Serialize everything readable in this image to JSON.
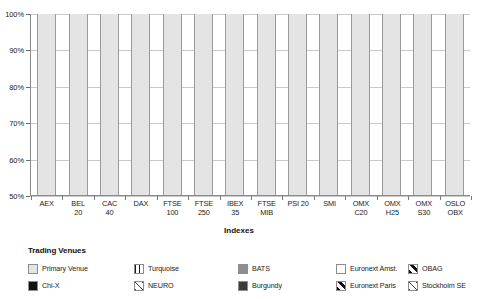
{
  "chart_data": {
    "type": "bar",
    "subtype": "stacked-percentage",
    "title": "",
    "xlabel": "Indexes",
    "ylabel": "",
    "ylim": [
      50,
      100
    ],
    "yticks": [
      "50%",
      "60%",
      "70%",
      "80%",
      "90%",
      "100%"
    ],
    "ytick_values": [
      50,
      60,
      70,
      80,
      90,
      100
    ],
    "grid": true,
    "legend_position": "bottom",
    "legend_title": "Trading Venues",
    "categories": [
      "AEX",
      "BEL 20",
      "CAC 40",
      "DAX",
      "FTSE 100",
      "FTSE 250",
      "IBEX 35",
      "FTSE MIB",
      "PSI 20",
      "SMI",
      "OMX C20",
      "OMX H25",
      "OMX S30",
      "OSLO OBX"
    ],
    "category_lines": [
      [
        "AEX",
        ""
      ],
      [
        "BEL",
        "20"
      ],
      [
        "CAC",
        "40"
      ],
      [
        "DAX",
        ""
      ],
      [
        "FTSE",
        "100"
      ],
      [
        "FTSE",
        "250"
      ],
      [
        "IBEX",
        "35"
      ],
      [
        "FTSE",
        "MIB"
      ],
      [
        "PSI 20",
        ""
      ],
      [
        "SMI",
        ""
      ],
      [
        "OMX",
        "C20"
      ],
      [
        "OMX",
        "H25"
      ],
      [
        "OMX",
        "S30"
      ],
      [
        "OSLO",
        "OBX"
      ]
    ],
    "series": [
      {
        "name": "Primary Venue",
        "key": "primary",
        "color": "#e4e4e4",
        "pattern": "solid",
        "values": [
          70.2,
          63.0,
          68.8,
          77.0,
          66.8,
          75.8,
          99.6,
          90.8,
          99.3,
          83.2,
          89.5,
          81.5,
          80.6,
          96.6
        ]
      },
      {
        "name": "Chi-X",
        "key": "chix",
        "color": "#131313",
        "pattern": "solid",
        "values": [
          14.6,
          16.8,
          13.9,
          16.4,
          21.0,
          15.3,
          0.0,
          5.1,
          0.0,
          12.1,
          8.0,
          13.0,
          14.3,
          2.0
        ]
      },
      {
        "name": "Turquoise",
        "key": "turquoise",
        "color": "#ffffff",
        "pattern": "vertical-lines",
        "values": [
          3.3,
          3.4,
          3.3,
          4.5,
          4.6,
          4.6,
          0.0,
          1.3,
          0.0,
          3.9,
          1.9,
          3.6,
          3.6,
          0.0
        ]
      },
      {
        "name": "Burgundy",
        "key": "burgundy",
        "color": "#3a3a3a",
        "pattern": "solid",
        "values": [
          0.0,
          0.0,
          0.0,
          0.0,
          0.0,
          0.0,
          0.0,
          0.0,
          0.0,
          0.0,
          0.0,
          0.0,
          0.0,
          0.0
        ]
      },
      {
        "name": "Euronext Amst.",
        "key": "euronext-amst",
        "color": "#ffffff",
        "pattern": "solid-white",
        "values": [
          0.0,
          0.0,
          6.6,
          0.0,
          0.0,
          0.0,
          0.0,
          0.0,
          0.0,
          0.0,
          0.0,
          0.0,
          0.0,
          0.0
        ]
      },
      {
        "name": "Euronext Paris",
        "key": "euronext-paris",
        "color": "#ffffff",
        "pattern": "thick-diagonal",
        "values": [
          7.6,
          16.8,
          0.0,
          0.0,
          0.0,
          0.0,
          0.0,
          0.0,
          0.0,
          0.0,
          0.0,
          0.0,
          0.0,
          0.0
        ]
      },
      {
        "name": "NEURO",
        "key": "neuro",
        "color": "#ffffff",
        "pattern": "thin-diagonal",
        "values": [
          0.0,
          0.0,
          0.0,
          0.0,
          0.0,
          0.0,
          0.0,
          0.0,
          0.0,
          0.0,
          0.0,
          1.4,
          0.0,
          1.4
        ]
      },
      {
        "name": "OBAG",
        "key": "obag",
        "color": "#ffffff",
        "pattern": "thick-diagonal",
        "values": [
          0.0,
          0.0,
          0.0,
          0.0,
          0.0,
          0.0,
          0.0,
          0.0,
          0.0,
          0.0,
          0.0,
          0.0,
          0.0,
          0.0
        ]
      },
      {
        "name": "BATS",
        "key": "bats",
        "color": "#8e8e8e",
        "pattern": "solid",
        "values": [
          4.3,
          0.0,
          7.4,
          2.1,
          7.6,
          4.3,
          0.4,
          2.8,
          0.7,
          0.8,
          0.6,
          0.5,
          1.5,
          0.0
        ]
      },
      {
        "name": "Stockholm SE",
        "key": "stockholm",
        "color": "#ffffff",
        "pattern": "thin-diagonal",
        "values": [
          0.0,
          0.0,
          0.0,
          0.0,
          0.0,
          0.0,
          0.0,
          0.0,
          0.0,
          0.0,
          0.0,
          0.0,
          0.0,
          0.0
        ]
      }
    ],
    "stack_order": [
      "primary",
      "chix",
      "turquoise",
      "euronext-amst",
      "bats",
      "neuro",
      "euronext-paris",
      "obag",
      "stockholm",
      "burgundy"
    ]
  },
  "axis": {
    "x_title": "Indexes",
    "y_ticks": [
      "100%",
      "90%",
      "80%",
      "70%",
      "60%",
      "50%"
    ]
  },
  "legend": {
    "title": "Trading Venues",
    "items": [
      {
        "label": "Primary Venue",
        "key": "primary"
      },
      {
        "label": "Chi-X",
        "key": "chix"
      },
      {
        "label": "Turquoise",
        "key": "turquoise"
      },
      {
        "label": "NEURO",
        "key": "neuro"
      },
      {
        "label": "BATS",
        "key": "bats"
      },
      {
        "label": "Burgundy",
        "key": "burgundy"
      },
      {
        "label": "Euronext Amst.",
        "key": "euronext-amst"
      },
      {
        "label": "Euronext Paris",
        "key": "euronext-paris"
      },
      {
        "label": "OBAG",
        "key": "obag"
      },
      {
        "label": "Stockholm SE",
        "key": "stockholm"
      }
    ]
  }
}
